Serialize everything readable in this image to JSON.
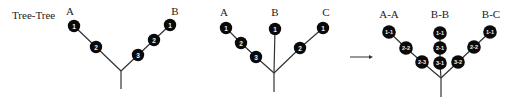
{
  "title": "Tree-Tree",
  "colors": {
    "node_fill": "#0a0a0a",
    "node_text": "#f2f2f2",
    "edge": "#333333",
    "text": "#222222"
  },
  "diagrams": [
    {
      "name": "tree-ab",
      "junction": {
        "x": 121,
        "y": 71
      },
      "stem_end": {
        "x": 121,
        "y": 89
      },
      "branches": [
        {
          "label": "A",
          "label_pos": {
            "x": 70,
            "y": 15
          },
          "nodes": [
            {
              "text": "1",
              "x": 74,
              "y": 26
            },
            {
              "text": "2",
              "x": 96,
              "y": 47
            }
          ]
        },
        {
          "label": "B",
          "label_pos": {
            "x": 175,
            "y": 15
          },
          "nodes": [
            {
              "text": "1",
              "x": 170,
              "y": 25
            },
            {
              "text": "2",
              "x": 154,
              "y": 40
            },
            {
              "text": "3",
              "x": 138,
              "y": 55
            }
          ]
        }
      ]
    },
    {
      "name": "tree-abc",
      "junction": {
        "x": 274,
        "y": 73
      },
      "stem_end": {
        "x": 274,
        "y": 92
      },
      "branches": [
        {
          "label": "A",
          "label_pos": {
            "x": 224,
            "y": 16
          },
          "nodes": [
            {
              "text": "1",
              "x": 226,
              "y": 28
            },
            {
              "text": "2",
              "x": 241,
              "y": 43
            },
            {
              "text": "3",
              "x": 256,
              "y": 57
            }
          ]
        },
        {
          "label": "B",
          "label_pos": {
            "x": 275,
            "y": 16
          },
          "nodes": [
            {
              "text": "1",
              "x": 275,
              "y": 29
            }
          ]
        },
        {
          "label": "C",
          "label_pos": {
            "x": 326,
            "y": 16
          },
          "nodes": [
            {
              "text": "1",
              "x": 323,
              "y": 28
            },
            {
              "text": "2",
              "x": 300,
              "y": 48
            }
          ]
        }
      ]
    },
    {
      "name": "tree-merged",
      "junction": {
        "x": 441,
        "y": 78
      },
      "stem_end": {
        "x": 441,
        "y": 97
      },
      "branches": [
        {
          "label": "A-A",
          "label_pos": {
            "x": 389,
            "y": 18
          },
          "nodes": [
            {
              "text": "1-1",
              "x": 389,
              "y": 32
            },
            {
              "text": "2-2",
              "x": 406,
              "y": 48
            },
            {
              "text": "2-3",
              "x": 422,
              "y": 62
            }
          ]
        },
        {
          "label": "B-B",
          "label_pos": {
            "x": 440,
            "y": 18
          },
          "nodes": [
            {
              "text": "1-1",
              "x": 440,
              "y": 33
            },
            {
              "text": "2-1",
              "x": 440,
              "y": 48
            },
            {
              "text": "3-1",
              "x": 440,
              "y": 63
            }
          ]
        },
        {
          "label": "B-C",
          "label_pos": {
            "x": 491,
            "y": 18
          },
          "nodes": [
            {
              "text": "1-1",
              "x": 490,
              "y": 32
            },
            {
              "text": "2-2",
              "x": 474,
              "y": 47
            },
            {
              "text": "3-2",
              "x": 458,
              "y": 62
            }
          ]
        }
      ]
    }
  ],
  "arrow": {
    "x1": 350,
    "y1": 57,
    "x2": 373,
    "y2": 57
  },
  "title_pos": {
    "x": 12,
    "y": 19
  }
}
